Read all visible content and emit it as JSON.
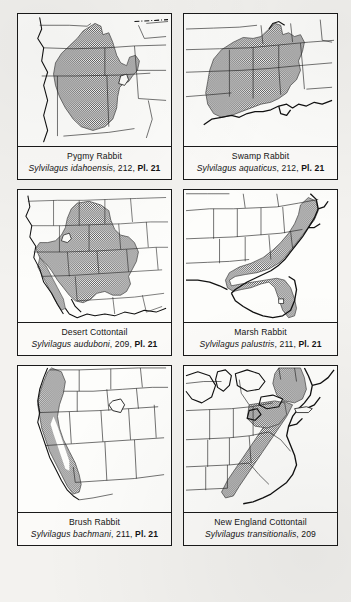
{
  "page": {
    "layout": "2 columns x 3 rows of range map panels",
    "ink_color": "#1a1a1a",
    "paper_color": "#f3f2ef",
    "range_fill_color": "#7d7d7d"
  },
  "panels": [
    {
      "id": "pygmy-rabbit",
      "common_name": "Pygmy Rabbit",
      "scientific_name": "Sylvilagus idahoensis",
      "page_ref": "212",
      "plate_ref": "Pl. 21",
      "separator": ", ",
      "region": "Great Basin, western United States",
      "map_extent": "western-us"
    },
    {
      "id": "swamp-rabbit",
      "common_name": "Swamp Rabbit",
      "scientific_name": "Sylvilagus aquaticus",
      "page_ref": "212",
      "plate_ref": "Pl. 21",
      "separator": ", ",
      "region": "Lower Mississippi Valley and Gulf states",
      "map_extent": "southeastern-us"
    },
    {
      "id": "desert-cottontail",
      "common_name": "Desert Cottontail",
      "scientific_name": "Sylvilagus auduboni",
      "page_ref": "209",
      "plate_ref": "Pl. 21",
      "separator": ", ",
      "region": "Southwestern United States and Great Plains",
      "map_extent": "western-us-wide"
    },
    {
      "id": "marsh-rabbit",
      "common_name": "Marsh Rabbit",
      "scientific_name": "Sylvilagus palustris",
      "page_ref": "211",
      "plate_ref": "Pl. 21",
      "separator": ", ",
      "region": "Atlantic and Gulf coastal plain, Florida",
      "map_extent": "southeastern-us"
    },
    {
      "id": "brush-rabbit",
      "common_name": "Brush Rabbit",
      "scientific_name": "Sylvilagus bachmani",
      "page_ref": "211",
      "plate_ref": "Pl. 21",
      "separator": ", ",
      "region": "Pacific coast, Oregon and California",
      "map_extent": "western-us"
    },
    {
      "id": "new-england-cottontail",
      "common_name": "New England Cottontail",
      "scientific_name": "Sylvilagus transitionalis",
      "page_ref": "209",
      "plate_ref": "",
      "separator": ", ",
      "region": "Appalachians and New England",
      "map_extent": "northeastern-us"
    }
  ]
}
